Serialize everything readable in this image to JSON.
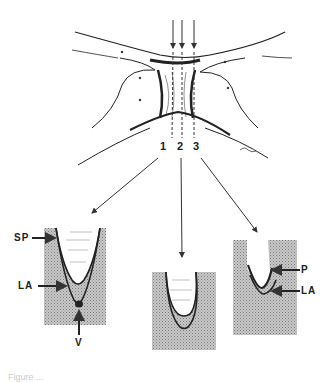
{
  "diagram": {
    "type": "anatomical schematic",
    "top_view": {
      "description": "Interdental / isthmus region with three probing paths",
      "probe_positions": [
        "1",
        "2",
        "3"
      ]
    },
    "sections": [
      {
        "id": "1",
        "labels": {
          "sp": "SP",
          "la": "LA",
          "v": "V"
        }
      },
      {
        "id": "2",
        "labels": {}
      },
      {
        "id": "3",
        "labels": {
          "p": "P",
          "la": "LA"
        }
      }
    ],
    "caption_partial": "Figure ..."
  }
}
